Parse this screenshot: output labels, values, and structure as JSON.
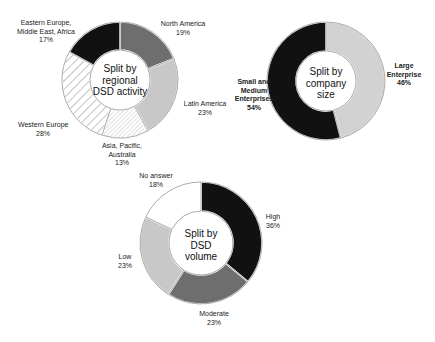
{
  "chart_data": [
    {
      "type": "pie",
      "variant": "donut",
      "title": "Split by regional DSD activity",
      "center_label": [
        "Split by",
        "regional",
        "DSD activity"
      ],
      "categories": [
        "North America",
        "Latin America",
        "Asia, Pacific, Australia",
        "Western Europe",
        "Eastern Europe, Middle East, Africa"
      ],
      "values": [
        19,
        23,
        13,
        28,
        17
      ],
      "unit": "%",
      "fills": [
        "#6e6e6e",
        "#c8c8c8",
        "hatch-fine",
        "hatch-diagonal",
        "#111111"
      ]
    },
    {
      "type": "pie",
      "variant": "donut",
      "title": "Split by company size",
      "center_label": [
        "Split by",
        "company",
        "size"
      ],
      "categories": [
        "Large Enterprise",
        "Small and Medium Enterprises"
      ],
      "values": [
        46,
        54
      ],
      "unit": "%",
      "fills": [
        "#d2d2d2",
        "#111111"
      ]
    },
    {
      "type": "pie",
      "variant": "donut",
      "title": "Split by DSD volume",
      "center_label": [
        "Split by",
        "DSD",
        "volume"
      ],
      "categories": [
        "High",
        "Moderate",
        "Low",
        "No answer"
      ],
      "values": [
        36,
        23,
        23,
        18
      ],
      "unit": "%",
      "fills": [
        "#111111",
        "#6e6e6e",
        "#c8c8c8",
        "#ffffff"
      ]
    }
  ],
  "labels": {
    "regional": {
      "north_america": [
        "North America",
        "19%"
      ],
      "latin_america": [
        "Latin America",
        "23%"
      ],
      "asia": [
        "Asia, Pacific,",
        "Australia",
        "13%"
      ],
      "western_europe": [
        "Western Europe",
        "28%"
      ],
      "eastern_europe": [
        "Eastern Europe,",
        "Middle East, Africa",
        "17%"
      ]
    },
    "company": {
      "large": [
        "Large",
        "Enterprise",
        "46%"
      ],
      "sme": [
        "Small and",
        "Medium",
        "Enterprises",
        "54%"
      ]
    },
    "volume": {
      "high": [
        "High",
        "36%"
      ],
      "moderate": [
        "Moderate",
        "23%"
      ],
      "low": [
        "Low",
        "23%"
      ],
      "no_answer": [
        "No answer",
        "18%"
      ]
    }
  }
}
